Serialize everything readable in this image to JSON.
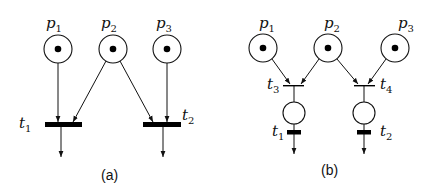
{
  "diagram": {
    "type": "petri-net",
    "colors": {
      "stroke": "#111111",
      "token": "#000000",
      "background": "#ffffff"
    },
    "panels": [
      {
        "caption": "(a)",
        "places": [
          {
            "id": "p1",
            "base": "p",
            "sub": "1",
            "tokens": 1
          },
          {
            "id": "p2",
            "base": "p",
            "sub": "2",
            "tokens": 1
          },
          {
            "id": "p3",
            "base": "p",
            "sub": "3",
            "tokens": 1
          }
        ],
        "transitions": [
          {
            "id": "t1",
            "base": "t",
            "sub": "1"
          },
          {
            "id": "t2",
            "base": "t",
            "sub": "2"
          }
        ],
        "arcs": [
          [
            "p1",
            "t1"
          ],
          [
            "p2",
            "t1"
          ],
          [
            "p2",
            "t2"
          ],
          [
            "p3",
            "t2"
          ],
          [
            "t1",
            "out"
          ],
          [
            "t2",
            "out"
          ]
        ]
      },
      {
        "caption": "(b)",
        "places": [
          {
            "id": "p1",
            "base": "p",
            "sub": "1",
            "tokens": 1
          },
          {
            "id": "p2",
            "base": "p",
            "sub": "2",
            "tokens": 1
          },
          {
            "id": "p3",
            "base": "p",
            "sub": "3",
            "tokens": 1
          },
          {
            "id": "q1",
            "base": "",
            "sub": "",
            "tokens": 0
          },
          {
            "id": "q2",
            "base": "",
            "sub": "",
            "tokens": 0
          }
        ],
        "transitions": [
          {
            "id": "t3",
            "base": "t",
            "sub": "3"
          },
          {
            "id": "t4",
            "base": "t",
            "sub": "4"
          },
          {
            "id": "t1",
            "base": "t",
            "sub": "1"
          },
          {
            "id": "t2",
            "base": "t",
            "sub": "2"
          }
        ],
        "arcs": [
          [
            "p1",
            "t3"
          ],
          [
            "p2",
            "t3"
          ],
          [
            "p2",
            "t4"
          ],
          [
            "p3",
            "t4"
          ],
          [
            "t3",
            "q1"
          ],
          [
            "t4",
            "q2"
          ],
          [
            "q1",
            "t1"
          ],
          [
            "q2",
            "t2"
          ],
          [
            "t1",
            "out"
          ],
          [
            "t2",
            "out"
          ]
        ]
      }
    ]
  }
}
